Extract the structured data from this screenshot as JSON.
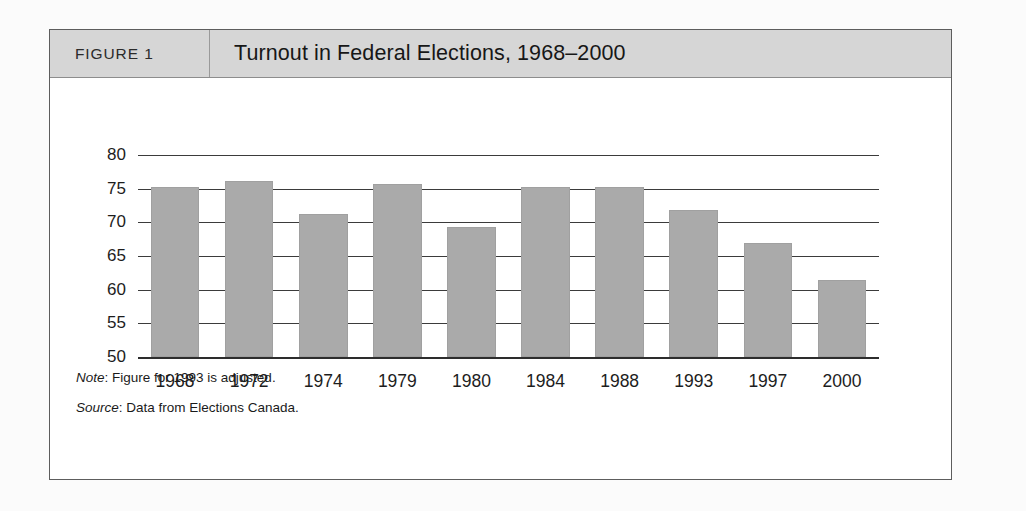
{
  "figure": {
    "label": "FIGURE 1",
    "title": "Turnout in Federal Elections, 1968–2000",
    "note_prefix": "Note",
    "note_text": ": Figure for 1993 is adjusted.",
    "source_prefix": "Source",
    "source_text": ": Data from Elections Canada."
  },
  "colors": {
    "bar_fill": "#aaaaaa",
    "header_band": "#d6d6d6",
    "frame_border": "#5d5d5d",
    "gridline": "#3b3b3b",
    "text": "#1d1d1d"
  },
  "chart_data": {
    "type": "bar",
    "title": "Turnout in Federal Elections, 1968–2000",
    "xlabel": "",
    "ylabel": "",
    "categories": [
      "1968",
      "1972",
      "1974",
      "1979",
      "1980",
      "1984",
      "1988",
      "1993",
      "1997",
      "2000"
    ],
    "values": [
      75.3,
      76.2,
      71.2,
      75.7,
      69.3,
      75.3,
      75.3,
      71.8,
      67.0,
      61.5
    ],
    "ylim": [
      50,
      80
    ],
    "yticks": [
      80,
      75,
      70,
      65,
      60,
      55,
      50
    ],
    "ytick_labels": [
      "80",
      "75",
      "70",
      "65",
      "60",
      "55",
      "50"
    ],
    "grid": true,
    "legend": false,
    "notes": [
      "Note: Figure for 1993 is adjusted.",
      "Source: Data from Elections Canada."
    ]
  }
}
